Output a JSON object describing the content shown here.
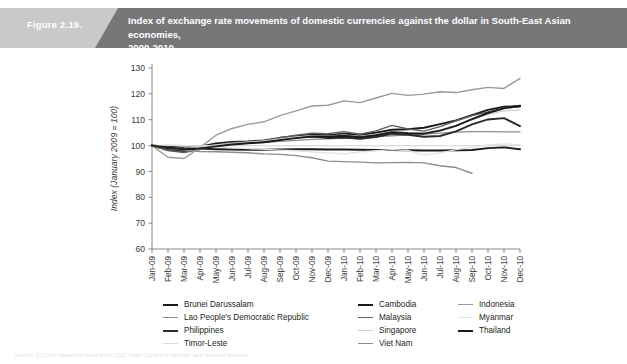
{
  "header": {
    "figure_number": "Figure 2.19.",
    "title_line1": "Index of exchange rate movements of domestic currencies against the dollar in South-East Asian economies,",
    "title_line2": "2009-2010",
    "band_gray": "#c9c9c9",
    "band_dark": "#77777a",
    "title_color": "#ffffff"
  },
  "source_note": {
    "text": "Source: ESCAP, based on data from CEIC Data Company Limited; and national sources."
  },
  "chart_data": {
    "type": "line",
    "title": "Index of exchange rate movements of domestic currencies against the dollar in South-East Asian economies, 2009-2010",
    "xlabel": "",
    "ylabel": "Index (January 2009 = 100)",
    "ylim": [
      60,
      130
    ],
    "yticks": [
      60,
      70,
      80,
      90,
      100,
      110,
      120,
      130
    ],
    "grid": false,
    "legend_position": "bottom",
    "x": [
      "Jan-09",
      "Feb-09",
      "Mar-09",
      "Apr-09",
      "May-09",
      "Jun-09",
      "Jul-09",
      "Aug-09",
      "Sep-09",
      "Oct-09",
      "Nov-09",
      "Dec-09",
      "Jan-10",
      "Feb-10",
      "Mar-10",
      "Apr-10",
      "May-10",
      "Jun-10",
      "Jul-10",
      "Aug-10",
      "Sep-10",
      "Oct-10",
      "Nov-10",
      "Dec-10"
    ],
    "series": [
      {
        "name": "Brunei Darussalam",
        "color": "#1a1a1a",
        "width": 1.9,
        "values": [
          100.0,
          99.0,
          98.6,
          99.6,
          100.8,
          101.4,
          101.6,
          102.0,
          103.0,
          103.6,
          104.2,
          104.0,
          104.6,
          104.2,
          105.0,
          106.1,
          106.3,
          106.9,
          108.3,
          109.7,
          111.8,
          113.8,
          115.0,
          115.3
        ]
      },
      {
        "name": "Lao People's Democratic Republic",
        "color": "#8c8c8c",
        "width": 1.3,
        "values": [
          100.0,
          99.8,
          99.5,
          99.8,
          100.2,
          100.6,
          100.9,
          101.2,
          101.6,
          102.0,
          102.4,
          102.6,
          102.9,
          103.2,
          103.5,
          103.8,
          104.1,
          104.4,
          104.8,
          105.2,
          105.4,
          105.4,
          105.3,
          105.3
        ]
      },
      {
        "name": "Philippines",
        "color": "#2b2b2b",
        "width": 1.9,
        "values": [
          100.0,
          98.3,
          97.9,
          98.9,
          100.0,
          100.6,
          101.1,
          101.4,
          102.3,
          103.2,
          103.6,
          102.9,
          103.1,
          102.6,
          103.3,
          104.6,
          104.2,
          103.4,
          103.7,
          105.5,
          108.2,
          110.1,
          110.6,
          107.5
        ]
      },
      {
        "name": "Timor-Leste",
        "color": "#dadada",
        "width": 1.3,
        "values": [
          100.0,
          100.0,
          100.0,
          100.0,
          100.0,
          100.0,
          100.0,
          100.0,
          100.0,
          100.0,
          100.0,
          100.0,
          100.0,
          100.0,
          100.0,
          100.0,
          100.0,
          100.0,
          100.0,
          100.0,
          100.0,
          100.0,
          100.0,
          100.0
        ]
      },
      {
        "name": "Cambodia",
        "color": "#1a1a1a",
        "width": 1.9,
        "values": [
          100.0,
          99.6,
          99.0,
          98.8,
          98.6,
          98.5,
          98.4,
          98.4,
          98.5,
          98.6,
          98.6,
          98.5,
          98.5,
          98.4,
          98.3,
          98.3,
          98.2,
          98.1,
          98.1,
          98.2,
          98.3,
          99.0,
          99.3,
          98.6
        ]
      },
      {
        "name": "Malaysia",
        "color": "#5f5f5f",
        "width": 1.4,
        "values": [
          100.0,
          98.1,
          97.3,
          98.5,
          100.2,
          101.1,
          101.4,
          101.8,
          103.0,
          104.0,
          104.8,
          104.6,
          105.4,
          104.4,
          105.7,
          107.8,
          106.4,
          105.6,
          107.3,
          109.6,
          111.6,
          113.0,
          114.6,
          114.9
        ]
      },
      {
        "name": "Singapore",
        "color": "#cfcfcf",
        "width": 1.4,
        "values": [
          100.0,
          99.4,
          98.8,
          99.4,
          100.2,
          100.8,
          101.3,
          101.8,
          102.6,
          103.3,
          103.8,
          103.6,
          104.1,
          103.4,
          104.2,
          105.4,
          105.0,
          104.8,
          106.0,
          107.8,
          110.0,
          112.0,
          113.4,
          113.8
        ]
      },
      {
        "name": "Viet Nam",
        "color": "#8c8c8c",
        "width": 1.4,
        "values": [
          100.0,
          99.3,
          98.3,
          97.7,
          97.6,
          97.4,
          97.2,
          96.8,
          96.6,
          96.1,
          95.3,
          94.0,
          93.8,
          93.6,
          93.3,
          93.4,
          93.5,
          93.3,
          92.2,
          91.5,
          89.3,
          null,
          null,
          null
        ]
      },
      {
        "name": "Indonesia",
        "color": "#9a9a9a",
        "width": 1.4,
        "values": [
          100.0,
          95.5,
          95.0,
          99.2,
          104.0,
          106.6,
          108.2,
          109.2,
          111.6,
          113.4,
          115.3,
          115.6,
          117.3,
          116.6,
          118.4,
          120.2,
          119.4,
          119.9,
          120.8,
          120.5,
          121.6,
          122.5,
          122.1,
          126.0
        ]
      },
      {
        "name": "Myanmar",
        "color": "#e2e2e2",
        "width": 1.3,
        "values": [
          100.0,
          100.3,
          100.1,
          99.8,
          99.5,
          99.1,
          98.8,
          98.5,
          98.2,
          98.0,
          97.6,
          97.2,
          96.8,
          97.6,
          98.0,
          98.4,
          98.1,
          96.4,
          97.2,
          98.4,
          99.3,
          100.3,
          100.6,
          100.4
        ]
      },
      {
        "name": "Thailand",
        "color": "#1a1a1a",
        "width": 1.9,
        "values": [
          100.0,
          99.3,
          98.6,
          98.9,
          99.7,
          100.4,
          100.9,
          101.3,
          102.1,
          102.9,
          103.5,
          103.4,
          103.8,
          103.2,
          104.0,
          105.2,
          104.8,
          104.6,
          105.8,
          107.6,
          110.2,
          112.6,
          114.4,
          115.4
        ]
      }
    ]
  },
  "legend": {
    "rows": [
      {
        "c1": {
          "label": "Brunei Darussalam",
          "color": "#1a1a1a",
          "width": 2.4
        },
        "c2": {
          "label": "Cambodia",
          "color": "#1a1a1a",
          "width": 2.4
        },
        "c3": {
          "label": "Indonesia",
          "color": "#9a9a9a",
          "width": 1.6
        }
      },
      {
        "c1": {
          "label": "Lao People's Democratic Republic",
          "color": "#8c8c8c",
          "width": 1.6
        },
        "c2": {
          "label": "Malaysia",
          "color": "#5f5f5f",
          "width": 1.8
        },
        "c3": {
          "label": "Myanmar",
          "color": "#e2e2e2",
          "width": 1.6
        }
      },
      {
        "c1": {
          "label": "Philippines",
          "color": "#2b2b2b",
          "width": 2.4
        },
        "c2": {
          "label": "Singapore",
          "color": "#cfcfcf",
          "width": 1.8
        },
        "c3": {
          "label": "Thailand",
          "color": "#1a1a1a",
          "width": 2.4
        }
      },
      {
        "c1": {
          "label": "Timor-Leste",
          "color": "#dadada",
          "width": 1.6
        },
        "c2": {
          "label": "Viet Nam",
          "color": "#8c8c8c",
          "width": 1.8
        },
        "c3": null
      }
    ]
  },
  "axis_style": {
    "line_color": "#7a7a7a",
    "tick_color": "#7a7a7a",
    "label_color": "#3a3a3a"
  }
}
